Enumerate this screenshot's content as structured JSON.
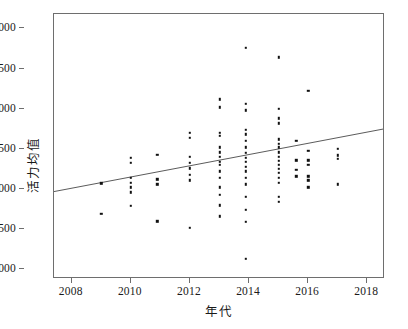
{
  "chart_data": {
    "type": "scatter",
    "title": "",
    "xlabel": "年代",
    "ylabel": "活力均值",
    "xlim": [
      2007.4,
      2018.6
    ],
    "ylim": [
      2880,
      6180
    ],
    "xticks": [
      2008,
      2010,
      2012,
      2014,
      2016,
      2018
    ],
    "xtick_labels": [
      "2008",
      "2010",
      "2012",
      "2014",
      "2016",
      "2018"
    ],
    "yticks": [
      3000,
      3500,
      4000,
      4500,
      5000,
      5500,
      6000
    ],
    "ytick_labels": [
      "3000",
      "3500",
      "4000",
      "4500",
      "5000",
      "5500",
      "6000"
    ],
    "grid": false,
    "legend": null,
    "marker": {
      "shape": "square",
      "size": 2.4,
      "color": "#111111"
    },
    "trendline": {
      "label": "linear fit",
      "color": "#5a5a5a",
      "width": 1,
      "x": [
        2007.4,
        2018.6
      ],
      "y": [
        3952,
        4736
      ]
    },
    "points": [
      {
        "x": 2009.0,
        "y": 4070
      },
      {
        "x": 2009.0,
        "y": 3690
      },
      {
        "x": 2010.0,
        "y": 4390
      },
      {
        "x": 2010.0,
        "y": 4330
      },
      {
        "x": 2010.0,
        "y": 4140
      },
      {
        "x": 2010.0,
        "y": 4080
      },
      {
        "x": 2010.0,
        "y": 4020
      },
      {
        "x": 2010.0,
        "y": 3960
      },
      {
        "x": 2010.0,
        "y": 3790
      },
      {
        "x": 2010.9,
        "y": 4430
      },
      {
        "x": 2010.9,
        "y": 4120
      },
      {
        "x": 2010.9,
        "y": 4060
      },
      {
        "x": 2010.9,
        "y": 3600
      },
      {
        "x": 2012.0,
        "y": 4700
      },
      {
        "x": 2012.0,
        "y": 4640
      },
      {
        "x": 2012.0,
        "y": 4400
      },
      {
        "x": 2012.0,
        "y": 4330
      },
      {
        "x": 2012.0,
        "y": 4260
      },
      {
        "x": 2012.0,
        "y": 4180
      },
      {
        "x": 2012.0,
        "y": 4110
      },
      {
        "x": 2012.0,
        "y": 3520
      },
      {
        "x": 2013.0,
        "y": 5120
      },
      {
        "x": 2013.0,
        "y": 5020
      },
      {
        "x": 2013.0,
        "y": 4700
      },
      {
        "x": 2013.0,
        "y": 4660
      },
      {
        "x": 2013.0,
        "y": 4520
      },
      {
        "x": 2013.0,
        "y": 4460
      },
      {
        "x": 2013.0,
        "y": 4400
      },
      {
        "x": 2013.0,
        "y": 4340
      },
      {
        "x": 2013.0,
        "y": 4300
      },
      {
        "x": 2013.0,
        "y": 4220
      },
      {
        "x": 2013.0,
        "y": 4140
      },
      {
        "x": 2013.0,
        "y": 4020
      },
      {
        "x": 2013.0,
        "y": 3930
      },
      {
        "x": 2013.0,
        "y": 3800
      },
      {
        "x": 2013.0,
        "y": 3660
      },
      {
        "x": 2013.9,
        "y": 5760
      },
      {
        "x": 2013.9,
        "y": 5060
      },
      {
        "x": 2013.9,
        "y": 4980
      },
      {
        "x": 2013.9,
        "y": 4740
      },
      {
        "x": 2013.9,
        "y": 4680
      },
      {
        "x": 2013.9,
        "y": 4600
      },
      {
        "x": 2013.9,
        "y": 4520
      },
      {
        "x": 2013.9,
        "y": 4450
      },
      {
        "x": 2013.9,
        "y": 4390
      },
      {
        "x": 2013.9,
        "y": 4340
      },
      {
        "x": 2013.9,
        "y": 4280
      },
      {
        "x": 2013.9,
        "y": 4220
      },
      {
        "x": 2013.9,
        "y": 4140
      },
      {
        "x": 2013.9,
        "y": 4060
      },
      {
        "x": 2013.9,
        "y": 3900
      },
      {
        "x": 2013.9,
        "y": 3740
      },
      {
        "x": 2013.9,
        "y": 3590
      },
      {
        "x": 2013.9,
        "y": 3130
      },
      {
        "x": 2015.0,
        "y": 5640
      },
      {
        "x": 2015.0,
        "y": 5000
      },
      {
        "x": 2015.0,
        "y": 4880
      },
      {
        "x": 2015.0,
        "y": 4820
      },
      {
        "x": 2015.0,
        "y": 4620
      },
      {
        "x": 2015.0,
        "y": 4560
      },
      {
        "x": 2015.0,
        "y": 4520
      },
      {
        "x": 2015.0,
        "y": 4460
      },
      {
        "x": 2015.0,
        "y": 4400
      },
      {
        "x": 2015.0,
        "y": 4350
      },
      {
        "x": 2015.0,
        "y": 4300
      },
      {
        "x": 2015.0,
        "y": 4250
      },
      {
        "x": 2015.0,
        "y": 4200
      },
      {
        "x": 2015.0,
        "y": 4140
      },
      {
        "x": 2015.0,
        "y": 4080
      },
      {
        "x": 2015.0,
        "y": 3900
      },
      {
        "x": 2015.0,
        "y": 3840
      },
      {
        "x": 2015.6,
        "y": 4600
      },
      {
        "x": 2015.6,
        "y": 4360
      },
      {
        "x": 2015.6,
        "y": 4240
      },
      {
        "x": 2015.6,
        "y": 4160
      },
      {
        "x": 2016.0,
        "y": 5220
      },
      {
        "x": 2016.0,
        "y": 4480
      },
      {
        "x": 2016.0,
        "y": 4360
      },
      {
        "x": 2016.0,
        "y": 4300
      },
      {
        "x": 2016.0,
        "y": 4160
      },
      {
        "x": 2016.0,
        "y": 4110
      },
      {
        "x": 2016.0,
        "y": 4020
      },
      {
        "x": 2017.0,
        "y": 4500
      },
      {
        "x": 2017.0,
        "y": 4420
      },
      {
        "x": 2017.0,
        "y": 4380
      },
      {
        "x": 2017.0,
        "y": 4060
      }
    ]
  }
}
